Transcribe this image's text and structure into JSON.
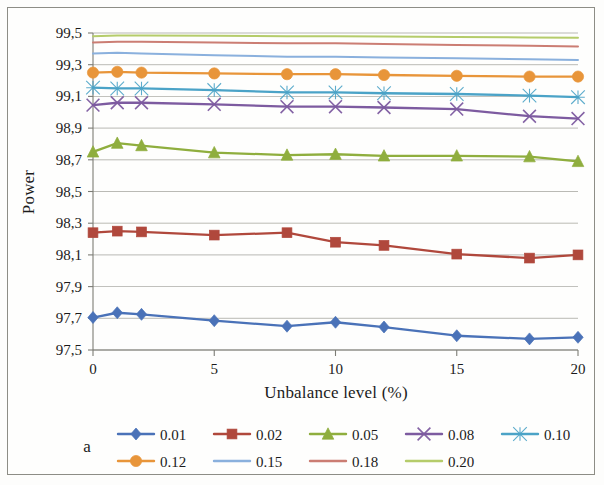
{
  "panel": {
    "label": "a"
  },
  "chart_data": {
    "type": "line",
    "title": "",
    "xlabel": "Unbalance level (%)",
    "ylabel": "Power",
    "xlim": [
      0,
      20
    ],
    "ylim": [
      97.5,
      99.5
    ],
    "yticks": [
      97.5,
      97.7,
      97.9,
      98.1,
      98.3,
      98.5,
      98.7,
      98.9,
      99.1,
      99.3,
      99.5
    ],
    "ytick_labels": [
      "97,5",
      "97,7",
      "97,9",
      "98,1",
      "98,3",
      "98,5",
      "98,7",
      "98,9",
      "99,1",
      "99,3",
      "99,5"
    ],
    "xticks": [
      0,
      5,
      10,
      15,
      20
    ],
    "xtick_labels": [
      "0",
      "5",
      "10",
      "15",
      "20"
    ],
    "grid": "horizontal",
    "legend_position": "bottom",
    "x": [
      0,
      1,
      2,
      5,
      8,
      10,
      12,
      15,
      18,
      20
    ],
    "series": [
      {
        "name": "0.01",
        "color": "#4a72b8",
        "marker": "diamond",
        "values": [
          97.705,
          97.735,
          97.725,
          97.685,
          97.65,
          97.675,
          97.645,
          97.59,
          97.57,
          97.58
        ]
      },
      {
        "name": "0.02",
        "color": "#b0483c",
        "marker": "square",
        "values": [
          98.24,
          98.25,
          98.245,
          98.225,
          98.24,
          98.18,
          98.16,
          98.105,
          98.08,
          98.1
        ]
      },
      {
        "name": "0.05",
        "color": "#8fae3e",
        "marker": "triangle",
        "values": [
          98.75,
          98.805,
          98.79,
          98.745,
          98.73,
          98.735,
          98.725,
          98.725,
          98.72,
          98.69
        ]
      },
      {
        "name": "0.08",
        "color": "#7d5ba0",
        "marker": "x",
        "values": [
          99.045,
          99.06,
          99.06,
          99.05,
          99.035,
          99.035,
          99.03,
          99.02,
          98.975,
          98.96
        ]
      },
      {
        "name": "0.10",
        "color": "#4ba3c7",
        "marker": "asterisk",
        "values": [
          99.155,
          99.15,
          99.15,
          99.14,
          99.125,
          99.125,
          99.12,
          99.115,
          99.105,
          99.095
        ]
      },
      {
        "name": "0.12",
        "color": "#e8953a",
        "marker": "circle",
        "values": [
          99.25,
          99.255,
          99.25,
          99.245,
          99.24,
          99.24,
          99.235,
          99.23,
          99.225,
          99.225
        ]
      },
      {
        "name": "0.15",
        "color": "#8ab0dd",
        "marker": "none",
        "values": [
          99.37,
          99.375,
          99.37,
          99.36,
          99.35,
          99.35,
          99.345,
          99.34,
          99.335,
          99.33
        ]
      },
      {
        "name": "0.18",
        "color": "#cb7d73",
        "marker": "none",
        "values": [
          99.44,
          99.445,
          99.445,
          99.44,
          99.435,
          99.435,
          99.43,
          99.425,
          99.42,
          99.415
        ]
      },
      {
        "name": "0.20",
        "color": "#b5cc6a",
        "marker": "none",
        "values": [
          99.48,
          99.485,
          99.485,
          99.482,
          99.48,
          99.48,
          99.478,
          99.475,
          99.472,
          99.47
        ]
      }
    ]
  }
}
